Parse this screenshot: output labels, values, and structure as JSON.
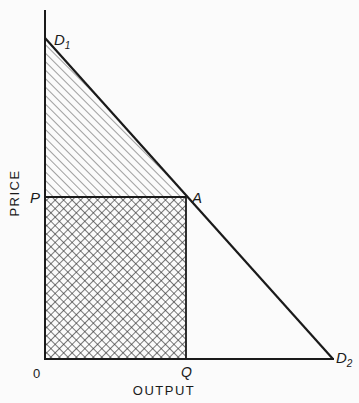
{
  "diagram": {
    "type": "demand-curve-consumer-surplus",
    "axes": {
      "y_label": "PRICE",
      "x_label": "OUTPUT",
      "origin_label": "0"
    },
    "points": {
      "d1": {
        "label": "D",
        "sub": "1"
      },
      "d2": {
        "label": "D",
        "sub": "2"
      },
      "a": {
        "label": "A"
      },
      "p": {
        "label": "P"
      },
      "q": {
        "label": "Q"
      }
    },
    "regions": [
      {
        "name": "triangle-above-price",
        "fill": "diagonal-hatch",
        "vertices": [
          "D1",
          "P",
          "A"
        ]
      },
      {
        "name": "rectangle-revenue",
        "fill": "cross-hatch",
        "vertices": [
          "0",
          "P",
          "A",
          "Q"
        ]
      }
    ],
    "colors": {
      "line": "#1a1a1a",
      "background": "#fbfbfb"
    }
  }
}
